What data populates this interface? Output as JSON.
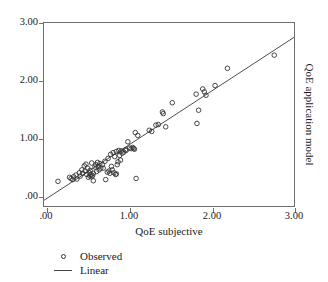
{
  "chart_data": {
    "type": "scatter",
    "title": "",
    "xlabel": "QoE subjective",
    "ylabel": "QoE application model",
    "xlim": [
      0.0,
      3.04
    ],
    "ylim": [
      0.0,
      3.19
    ],
    "grid": false,
    "xticks": [
      0.0,
      1.0,
      2.0,
      3.0
    ],
    "xticklabels": [
      ".00",
      "1.00",
      "2.00",
      "3.00"
    ],
    "yticks": [
      0.0,
      1.0,
      2.0,
      3.0
    ],
    "yticklabels": [
      ".00",
      "1.00",
      "2.00",
      "3.00"
    ],
    "legend_position": "below-left",
    "series": [
      {
        "name": "Observed",
        "type": "scatter",
        "marker": "open-circle",
        "marker_color": "#333333",
        "points": [
          [
            0.17,
            0.43
          ],
          [
            0.31,
            0.5
          ],
          [
            0.33,
            0.48
          ],
          [
            0.35,
            0.46
          ],
          [
            0.36,
            0.51
          ],
          [
            0.39,
            0.54
          ],
          [
            0.4,
            0.47
          ],
          [
            0.43,
            0.58
          ],
          [
            0.44,
            0.52
          ],
          [
            0.46,
            0.63
          ],
          [
            0.47,
            0.57
          ],
          [
            0.49,
            0.7
          ],
          [
            0.5,
            0.61
          ],
          [
            0.51,
            0.73
          ],
          [
            0.52,
            0.55
          ],
          [
            0.53,
            0.66
          ],
          [
            0.54,
            0.5
          ],
          [
            0.55,
            0.58
          ],
          [
            0.56,
            0.52
          ],
          [
            0.56,
            0.62
          ],
          [
            0.57,
            0.55
          ],
          [
            0.58,
            0.75
          ],
          [
            0.58,
            0.51
          ],
          [
            0.59,
            0.53
          ],
          [
            0.6,
            0.57
          ],
          [
            0.6,
            0.44
          ],
          [
            0.62,
            0.68
          ],
          [
            0.63,
            0.72
          ],
          [
            0.64,
            0.6
          ],
          [
            0.65,
            0.76
          ],
          [
            0.66,
            0.69
          ],
          [
            0.67,
            0.63
          ],
          [
            0.68,
            0.74
          ],
          [
            0.69,
            0.66
          ],
          [
            0.71,
            0.72
          ],
          [
            0.72,
            0.66
          ],
          [
            0.74,
            0.78
          ],
          [
            0.75,
            0.46
          ],
          [
            0.77,
            0.59
          ],
          [
            0.78,
            0.83
          ],
          [
            0.79,
            0.61
          ],
          [
            0.8,
            0.57
          ],
          [
            0.81,
            0.9
          ],
          [
            0.82,
            0.69
          ],
          [
            0.83,
            0.63
          ],
          [
            0.84,
            0.93
          ],
          [
            0.85,
            0.58
          ],
          [
            0.86,
            0.86
          ],
          [
            0.87,
            0.55
          ],
          [
            0.88,
            0.95
          ],
          [
            0.88,
            0.56
          ],
          [
            0.89,
            0.72
          ],
          [
            0.9,
            0.77
          ],
          [
            0.91,
            0.97
          ],
          [
            0.92,
            0.88
          ],
          [
            0.93,
            0.8
          ],
          [
            0.94,
            0.96
          ],
          [
            0.95,
            0.92
          ],
          [
            0.97,
            0.94
          ],
          [
            0.99,
            0.98
          ],
          [
            1.0,
            0.97
          ],
          [
            1.02,
            1.12
          ],
          [
            1.04,
            1.01
          ],
          [
            1.06,
            1.0
          ],
          [
            1.08,
            1.02
          ],
          [
            1.09,
            1.0
          ],
          [
            1.1,
            0.99
          ],
          [
            1.11,
            1.28
          ],
          [
            1.12,
            0.48
          ],
          [
            1.14,
            1.23
          ],
          [
            1.28,
            1.32
          ],
          [
            1.31,
            1.3
          ],
          [
            1.36,
            1.41
          ],
          [
            1.39,
            1.42
          ],
          [
            1.44,
            1.64
          ],
          [
            1.45,
            1.61
          ],
          [
            1.48,
            1.38
          ],
          [
            1.56,
            1.8
          ],
          [
            1.85,
            1.95
          ],
          [
            1.86,
            1.44
          ],
          [
            1.88,
            1.67
          ],
          [
            1.93,
            2.04
          ],
          [
            1.95,
            1.99
          ],
          [
            1.97,
            1.93
          ],
          [
            2.08,
            2.1
          ],
          [
            2.23,
            2.4
          ],
          [
            2.8,
            2.63
          ]
        ]
      },
      {
        "name": "Linear",
        "type": "line",
        "line_color": "#4a4a4a",
        "slope": 0.935,
        "intercept": 0.1,
        "x_start": 0.0,
        "x_end": 3.04,
        "y_start": 0.1,
        "y_end": 2.94
      }
    ]
  },
  "legend": {
    "items": [
      {
        "label": "Observed",
        "key": "open-circle"
      },
      {
        "label": "Linear",
        "key": "line"
      }
    ]
  },
  "axes": {
    "x_title": "QoE subjective",
    "y_title_right": "QoE application model"
  }
}
